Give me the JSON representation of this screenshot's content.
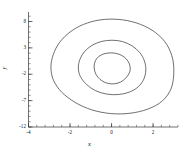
{
  "chart_data": {
    "type": "line",
    "title": "",
    "subtitle": "",
    "xlabel": "x",
    "ylabel": "y",
    "xlim": [
      -4,
      3.2
    ],
    "ylim": [
      -12,
      9.8
    ],
    "xticks": [
      -4,
      -2,
      0,
      2
    ],
    "xtick_labels": [
      "-4",
      "-2",
      "0",
      "2"
    ],
    "yticks": [
      8,
      3,
      -2,
      -7,
      -12
    ],
    "ytick_labels": [
      "8",
      "3",
      "-2",
      "-7",
      "-12"
    ],
    "grid": false,
    "legend": null,
    "legend_position": "none",
    "axis_style": "spines-left-bottom",
    "minor_ticks": true,
    "line_color": "#222222",
    "background": "#ffffff",
    "series": [
      {
        "name": "orbit-inner",
        "closed": true,
        "center": [
          0.05,
          -1.2
        ],
        "rx": 0.85,
        "ry": 3.1,
        "points_x": [
          0.9,
          0.86,
          0.72,
          0.5,
          0.22,
          -0.08,
          -0.38,
          -0.62,
          -0.78,
          -0.84,
          -0.8,
          -0.66,
          -0.44,
          -0.16,
          0.16,
          0.45,
          0.68,
          0.83,
          0.9
        ],
        "points_y": [
          -1.1,
          -0.05,
          0.85,
          1.55,
          1.95,
          2.05,
          1.85,
          1.35,
          0.55,
          -0.45,
          -1.55,
          -2.55,
          -3.3,
          -3.75,
          -3.8,
          -3.45,
          -2.75,
          -1.95,
          -1.1
        ]
      },
      {
        "name": "orbit-middle",
        "closed": true,
        "center": [
          0.02,
          -1.6
        ],
        "rx": 1.62,
        "ry": 5.6,
        "points_x": [
          1.65,
          1.58,
          1.35,
          0.98,
          0.52,
          0.02,
          -0.5,
          -0.95,
          -1.3,
          -1.52,
          -1.6,
          -1.5,
          -1.2,
          -0.78,
          -0.25,
          0.32,
          0.85,
          1.28,
          1.55,
          1.65
        ],
        "points_y": [
          -1.2,
          0.55,
          2.15,
          3.4,
          4.2,
          4.45,
          4.2,
          3.45,
          2.3,
          0.85,
          -0.8,
          -2.45,
          -3.95,
          -5.1,
          -5.75,
          -5.85,
          -5.4,
          -4.4,
          -2.95,
          -1.2
        ]
      },
      {
        "name": "orbit-outer",
        "closed": true,
        "center": [
          0.0,
          -2.0
        ],
        "rx": 2.95,
        "ry": 9.4,
        "points_x": [
          3.0,
          2.9,
          2.55,
          1.95,
          1.18,
          0.32,
          -0.55,
          -1.35,
          -2.0,
          -2.5,
          -2.8,
          -2.92,
          -2.8,
          -2.4,
          -1.75,
          -0.95,
          -0.05,
          0.88,
          1.75,
          2.45,
          2.88,
          3.0
        ],
        "points_y": [
          -1.4,
          1.55,
          4.25,
          6.35,
          7.75,
          8.4,
          8.3,
          7.45,
          6.0,
          4.05,
          1.8,
          -0.65,
          -3.1,
          -5.4,
          -7.35,
          -8.75,
          -9.45,
          -9.4,
          -8.6,
          -7.05,
          -4.6,
          -1.4
        ]
      }
    ]
  }
}
